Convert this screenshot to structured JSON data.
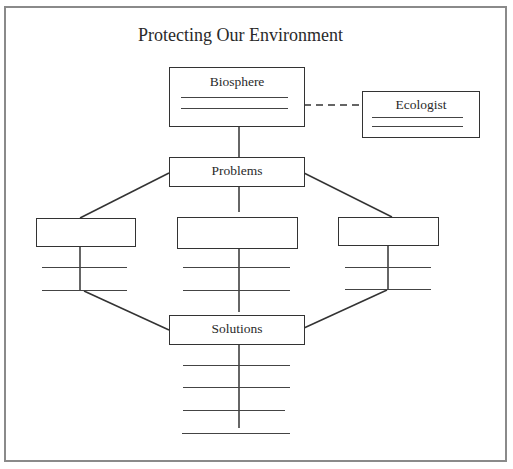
{
  "title": "Protecting Our Environment",
  "nodes": {
    "biosphere": {
      "label": "Biosphere",
      "blank_lines": 2
    },
    "ecologist": {
      "label": "Ecologist",
      "blank_lines": 2
    },
    "problems": {
      "label": "Problems"
    },
    "problem_1": {
      "label": "",
      "blank_lines": 2
    },
    "problem_2": {
      "label": "",
      "blank_lines": 2
    },
    "problem_3": {
      "label": "",
      "blank_lines": 2
    },
    "solutions": {
      "label": "Solutions",
      "blank_lines": 4
    }
  },
  "edges": [
    {
      "from": "biosphere",
      "to": "ecologist",
      "style": "dashed"
    },
    {
      "from": "biosphere",
      "to": "problems",
      "style": "solid"
    },
    {
      "from": "problems",
      "to": "problem_1",
      "style": "solid"
    },
    {
      "from": "problems",
      "to": "problem_2",
      "style": "solid"
    },
    {
      "from": "problems",
      "to": "problem_3",
      "style": "solid"
    },
    {
      "from": "problem_1",
      "to": "solutions",
      "style": "solid"
    },
    {
      "from": "problem_2",
      "to": "solutions",
      "style": "solid"
    },
    {
      "from": "problem_3",
      "to": "solutions",
      "style": "solid"
    }
  ],
  "colors": {
    "line": "#333333",
    "frame": "#8a8a8a",
    "background": "#ffffff"
  }
}
